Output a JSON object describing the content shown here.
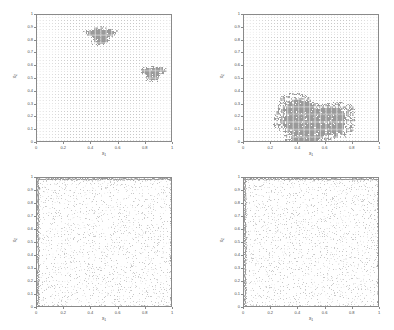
{
  "figure": {
    "width": 394,
    "height": 330,
    "background": "#ffffff",
    "dot_color": "#c8c8c8",
    "cluster_color": "#9a9a9a",
    "axis_color": "#8a8a8a",
    "text_color": "#4a4a4a"
  },
  "axis_labels": {
    "x": "x",
    "x_sub": "1",
    "y": "x",
    "y_sub": "2"
  },
  "ticks": {
    "x": [
      "0",
      "0.2",
      "0.4",
      "0.6",
      "0.8",
      "1"
    ],
    "x_values": [
      0,
      0.2,
      0.4,
      0.6,
      0.8,
      1
    ],
    "y": [
      "0",
      "0.1",
      "0.2",
      "0.3",
      "0.4",
      "0.5",
      "0.6",
      "0.7",
      "0.8",
      "0.9",
      "1"
    ],
    "y_values": [
      0,
      0.1,
      0.2,
      0.3,
      0.4,
      0.5,
      0.6,
      0.7,
      0.8,
      0.9,
      1
    ]
  },
  "chart_data": {
    "type": "scatter",
    "title": "",
    "xlabel": "x1",
    "ylabel": "x2",
    "xlim": [
      0,
      1
    ],
    "ylim": [
      0,
      1
    ],
    "grid": false,
    "legend": null,
    "panel_count": 4,
    "panels": [
      {
        "id": "panel-top-left",
        "position": "top-left",
        "description": "Uniform background lattice of sample points with two dense elliptical clusters of accepted samples",
        "background_lattice": {
          "type": "regular-grid",
          "nx": 45,
          "ny": 45,
          "spacing": 0.0222
        },
        "clusters": [
          {
            "name": "cluster-upper-left",
            "cx": 0.47,
            "cy": 0.84,
            "rx": 0.105,
            "ry": 0.075,
            "density": 1.0
          },
          {
            "name": "cluster-right",
            "cx": 0.855,
            "cy": 0.545,
            "rx": 0.085,
            "ry": 0.062,
            "density": 1.0
          }
        ],
        "scatter_mode": "lattice-plus-clusters"
      },
      {
        "id": "panel-top-right",
        "position": "top-right",
        "description": "Uniform background lattice with one large dense cluster occupying the lower-central region",
        "background_lattice": {
          "type": "regular-grid",
          "nx": 45,
          "ny": 45,
          "spacing": 0.0222
        },
        "clusters": [
          {
            "name": "cluster-lower-center",
            "cx": 0.5,
            "cy": 0.16,
            "rx": 0.3,
            "ry": 0.21,
            "density": 1.0
          }
        ],
        "scatter_mode": "lattice-plus-clusters"
      },
      {
        "id": "panel-bottom-left",
        "position": "bottom-left",
        "description": "Irregular quasi-random scatter covering the full unit square with denser accumulation along the frame boundary",
        "background_lattice": {
          "type": "jittered-random",
          "n_points": 1500
        },
        "clusters": [],
        "scatter_mode": "random-uniform-with-edges"
      },
      {
        "id": "panel-bottom-right",
        "position": "bottom-right",
        "description": "Irregular quasi-random scatter covering the full unit square with denser accumulation along the frame boundary",
        "background_lattice": {
          "type": "jittered-random",
          "n_points": 1600
        },
        "clusters": [],
        "scatter_mode": "random-uniform-with-edges"
      }
    ]
  },
  "panel_geometry": [
    {
      "id": "panel-top-left",
      "left": 36,
      "top": 14,
      "width": 136,
      "height": 128
    },
    {
      "id": "panel-top-right",
      "left": 243,
      "top": 14,
      "width": 136,
      "height": 128
    },
    {
      "id": "panel-bottom-left",
      "left": 36,
      "top": 177,
      "width": 136,
      "height": 130
    },
    {
      "id": "panel-bottom-right",
      "left": 243,
      "top": 177,
      "width": 136,
      "height": 130
    }
  ]
}
